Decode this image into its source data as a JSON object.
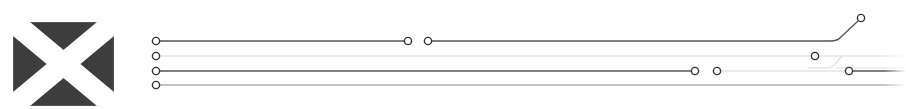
{
  "flag": {
    "icon": "saltire-flag-icon",
    "background_color": "#3d3d3d",
    "cross_color": "#ffffff",
    "border_color": "#555555"
  },
  "diagram": {
    "type": "track-lines",
    "colors": {
      "dark_line": "#555555",
      "light_line": "#d6d6d6",
      "medium_line": "#8a8a8a",
      "node_stroke": "#333333",
      "node_fill": "#ffffff"
    },
    "lines": [
      {
        "id": "line-1",
        "y": 41,
        "start_node": [
          156,
          41
        ],
        "segments": [
          [
            156,
            408
          ],
          [
            428,
            835
          ]
        ],
        "nodes": [
          [
            408,
            41
          ],
          [
            428,
            41
          ],
          [
            861,
            18
          ]
        ],
        "branch_up_to": [
          861,
          18
        ]
      },
      {
        "id": "line-2",
        "y": 56,
        "start_node": [
          156,
          56
        ],
        "segments": [
          [
            156,
            906
          ]
        ],
        "nodes": [
          [
            815,
            56
          ]
        ],
        "branch_down_to": [
          906,
          70
        ]
      },
      {
        "id": "line-3",
        "y": 71,
        "start_node": [
          156,
          71
        ],
        "segments": [
          [
            156,
            695
          ],
          [
            717,
            906
          ]
        ],
        "nodes": [
          [
            695,
            71
          ],
          [
            717,
            71
          ],
          [
            849,
            71
          ]
        ]
      },
      {
        "id": "line-4",
        "y": 85,
        "start_node": [
          156,
          85
        ],
        "segments": [
          [
            156,
            906
          ]
        ],
        "nodes": []
      }
    ]
  }
}
